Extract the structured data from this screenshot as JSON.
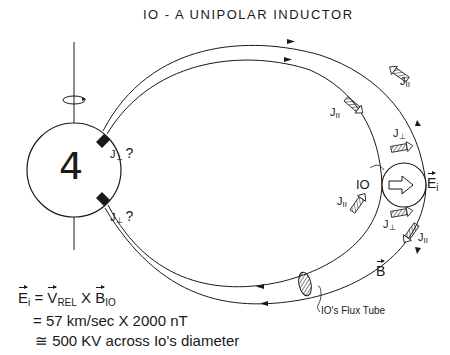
{
  "title": "IO - A UNIPOLAR INDUCTOR",
  "planet": {
    "symbol": "♃",
    "glyph_text": "4",
    "label_name": "Jupiter",
    "rotation_icon": "rotation-arrow-icon"
  },
  "labels": {
    "j_perp_upper": "J",
    "j_perp_upper_sub": "⊥",
    "j_perp_upper_q": "?",
    "j_perp_lower": "J",
    "j_perp_lower_sub": "⊥",
    "j_perp_lower_q": "?",
    "j_par_outer_top": "J",
    "j_par_outer_top_sub": "II",
    "j_par_inner_top": "J",
    "j_par_inner_top_sub": "II",
    "j_perp_io_top": "J",
    "j_perp_io_top_sub": "⊥",
    "io": "IO",
    "e_i": "E",
    "e_i_sub": "i",
    "j_par_inner_bottom": "J",
    "j_par_inner_bottom_sub": "II",
    "j_perp_io_bottom": "J",
    "j_perp_io_bottom_sub": "⊥",
    "j_par_outer_bottom": "J",
    "j_par_outer_bottom_sub": "II",
    "b_field": "B",
    "flux_tube": "IO's  Flux Tube"
  },
  "equation": {
    "line1": {
      "lhs": "E",
      "lhs_sub": "i",
      "eq": " = ",
      "v": "V",
      "v_sub": "REL",
      "times": " X ",
      "b": "B",
      "b_sub": "IO"
    },
    "line2": "= 57 km/sec  X  2000 nT",
    "line3": "≅ 500 KV across Io's diameter"
  },
  "colors": {
    "ink": "#1a1a1a",
    "background": "#ffffff"
  }
}
